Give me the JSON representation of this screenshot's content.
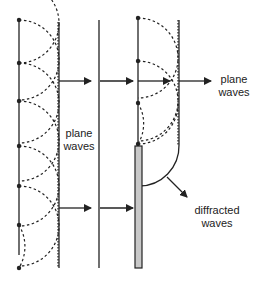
{
  "diagram": {
    "labels": {
      "plane_waves_mid_1": "plane",
      "plane_waves_mid_2": "waves",
      "plane_waves_right_1": "plane",
      "plane_waves_right_2": "waves",
      "diffracted_1": "diffracted",
      "diffracted_2": "waves"
    },
    "colors": {
      "line": "#222222",
      "barrier_fill": "#c8c8c8",
      "background": "#ffffff"
    }
  }
}
